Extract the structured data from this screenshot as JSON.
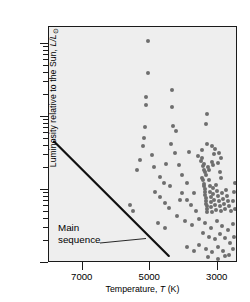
{
  "chart_data": {
    "type": "scatter",
    "title": "",
    "xlabel": "Temperature, T (K)",
    "xlabel_parts": {
      "prefix": "Temperature, ",
      "symbol": "T",
      "suffix": " (K)"
    },
    "ylabel": "Luminosity relative to the Sun, L/L⊙",
    "ylabel_parts": {
      "prefix": "Luminosity relative to the Sun, ",
      "symbol": "L/L",
      "sub": "⊙"
    },
    "xscale": "linear",
    "yscale": "log",
    "x_inverted": true,
    "xlim": [
      8000,
      2400
    ],
    "ylim": [
      0.1,
      170
    ],
    "xticks": [
      7000,
      5000,
      3000
    ],
    "xticklabels": [
      "7000",
      "5000",
      "3000"
    ],
    "yticks": [
      0.1,
      1,
      10,
      100
    ],
    "yticklabels": [
      "0.1",
      "1",
      "10",
      "100"
    ],
    "y_minor_ticks": [
      0.2,
      0.3,
      0.4,
      0.5,
      0.6,
      0.7,
      0.8,
      0.9,
      2,
      3,
      4,
      5,
      6,
      7,
      8,
      9,
      20,
      30,
      40,
      50,
      60,
      70,
      80,
      90
    ],
    "grid": false,
    "legend": null,
    "marker_color": "#6e6e6e",
    "plot_background": "#eeeeee",
    "frame_color": "#1a1a1a",
    "annotations": [
      {
        "text_line1": "Main",
        "text_line2": "sequence",
        "points_to": "main-sequence-line"
      }
    ],
    "series": [
      {
        "name": "main sequence",
        "type": "line",
        "color": "#111111",
        "x": [
          7850,
          4450
        ],
        "y": [
          4.6,
          0.125
        ]
      },
      {
        "name": "stars",
        "type": "scatter",
        "color": "#6e6e6e",
        "points": [
          [
            5060,
            108
          ],
          [
            5060,
            40
          ],
          [
            5120,
            19
          ],
          [
            5120,
            14.5
          ],
          [
            4360,
            23
          ],
          [
            4360,
            13.5
          ],
          [
            5150,
            7.2
          ],
          [
            5200,
            5.2
          ],
          [
            4330,
            7.6
          ],
          [
            4240,
            6.4
          ],
          [
            3320,
            11.0
          ],
          [
            3340,
            7.9
          ],
          [
            5220,
            4.0
          ],
          [
            4400,
            4.3
          ],
          [
            3330,
            4.2
          ],
          [
            3180,
            4.0
          ],
          [
            3090,
            3.6
          ],
          [
            3100,
            3.1
          ],
          [
            4260,
            3.2
          ],
          [
            3860,
            3.3
          ],
          [
            3600,
            2.9
          ],
          [
            3480,
            2.7
          ],
          [
            3470,
            3.5
          ],
          [
            2960,
            3.2
          ],
          [
            2900,
            2.7
          ],
          [
            4520,
            2.3
          ],
          [
            4150,
            2.2
          ],
          [
            3490,
            2.5
          ],
          [
            3420,
            2.3
          ],
          [
            3440,
            2.1
          ],
          [
            3400,
            1.9
          ],
          [
            3380,
            1.75
          ],
          [
            3360,
            1.6
          ],
          [
            3300,
            2.05
          ],
          [
            3250,
            1.85
          ],
          [
            3180,
            2.4
          ],
          [
            3150,
            2.2
          ],
          [
            2980,
            2.35
          ],
          [
            2920,
            1.75
          ],
          [
            4720,
            1.5
          ],
          [
            4600,
            1.25
          ],
          [
            4050,
            1.6
          ],
          [
            3460,
            1.45
          ],
          [
            3430,
            1.35
          ],
          [
            3420,
            1.22
          ],
          [
            3400,
            1.12
          ],
          [
            3390,
            1.02
          ],
          [
            3380,
            0.93
          ],
          [
            3370,
            0.85
          ],
          [
            3360,
            0.78
          ],
          [
            3350,
            0.71
          ],
          [
            3340,
            0.65
          ],
          [
            3330,
            0.6
          ],
          [
            3320,
            0.55
          ],
          [
            3310,
            0.5
          ],
          [
            3250,
            1.35
          ],
          [
            3240,
            1.12
          ],
          [
            3230,
            0.95
          ],
          [
            3210,
            0.8
          ],
          [
            3200,
            0.68
          ],
          [
            3190,
            0.58
          ],
          [
            3180,
            0.5
          ],
          [
            3150,
            1.05
          ],
          [
            3130,
            0.88
          ],
          [
            3110,
            0.74
          ],
          [
            3080,
            0.62
          ],
          [
            3060,
            0.53
          ],
          [
            3040,
            1.18
          ],
          [
            3020,
            0.98
          ],
          [
            2990,
            0.82
          ],
          [
            2960,
            0.7
          ],
          [
            2940,
            0.6
          ],
          [
            2910,
            0.52
          ],
          [
            2880,
            0.9
          ],
          [
            2850,
            0.75
          ],
          [
            2820,
            0.64
          ],
          [
            2790,
            0.55
          ],
          [
            2760,
            1.0
          ],
          [
            2720,
            0.83
          ],
          [
            2690,
            0.7
          ],
          [
            2660,
            0.6
          ],
          [
            2620,
            0.52
          ],
          [
            4850,
            0.95
          ],
          [
            4700,
            0.8
          ],
          [
            4560,
            0.66
          ],
          [
            4430,
            0.56
          ],
          [
            4050,
            0.92
          ],
          [
            3900,
            0.74
          ],
          [
            3780,
            0.62
          ],
          [
            3640,
            0.52
          ],
          [
            4200,
            0.44
          ],
          [
            3980,
            0.38
          ],
          [
            3760,
            0.33
          ],
          [
            3560,
            0.4
          ],
          [
            3380,
            0.35
          ],
          [
            3200,
            0.3
          ],
          [
            3020,
            0.37
          ],
          [
            2860,
            0.32
          ],
          [
            2700,
            0.28
          ],
          [
            2560,
            0.34
          ],
          [
            3440,
            0.26
          ],
          [
            3260,
            0.23
          ],
          [
            3090,
            0.21
          ],
          [
            2930,
            0.25
          ],
          [
            2780,
            0.22
          ],
          [
            2630,
            0.19
          ],
          [
            2520,
            0.23
          ],
          [
            3560,
            0.175
          ],
          [
            3360,
            0.155
          ],
          [
            3170,
            0.14
          ],
          [
            2990,
            0.165
          ],
          [
            2830,
            0.145
          ],
          [
            2670,
            0.13
          ],
          [
            2540,
            0.155
          ],
          [
            3700,
            0.145
          ],
          [
            3900,
            0.165
          ],
          [
            2980,
            0.115
          ],
          [
            2800,
            0.125
          ],
          [
            3300,
            0.12
          ],
          [
            4550,
            0.3
          ],
          [
            4760,
            0.35
          ],
          [
            5300,
            2.6
          ],
          [
            5380,
            1.9
          ],
          [
            4950,
            3.0
          ],
          [
            4880,
            2.05
          ],
          [
            3900,
            1.25
          ],
          [
            4420,
            1.15
          ],
          [
            2560,
            0.7
          ],
          [
            2530,
            0.95
          ],
          [
            2500,
            1.25
          ],
          [
            2480,
            0.55
          ],
          [
            3700,
            0.9
          ],
          [
            4120,
            0.72
          ],
          [
            5500,
            0.52
          ],
          [
            5600,
            0.62
          ],
          [
            2900,
            1.45
          ]
        ]
      }
    ]
  }
}
